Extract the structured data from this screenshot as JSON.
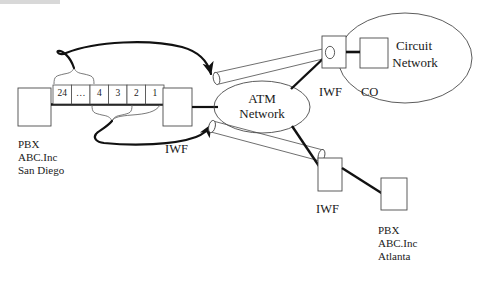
{
  "diagram": {
    "colors": {
      "stroke": "#1a1a1a",
      "thin_stroke": "#555555",
      "background": "#ffffff",
      "text": "#1a1a1a"
    },
    "nodes": {
      "pbx_left": {
        "label": "",
        "x": 18,
        "y": 88,
        "w": 33,
        "h": 38
      },
      "iwf_left": {
        "label": "IWF",
        "x": 163,
        "y": 88,
        "w": 29,
        "h": 38
      },
      "iwf_top": {
        "label": "IWF",
        "x": 322,
        "y": 36,
        "w": 24,
        "h": 32
      },
      "co": {
        "label": "CO",
        "x": 360,
        "y": 38,
        "w": 28,
        "h": 30
      },
      "iwf_bottom": {
        "label": "IWF",
        "x": 318,
        "y": 158,
        "w": 24,
        "h": 33
      },
      "pbx_right": {
        "label": "",
        "x": 381,
        "y": 178,
        "w": 26,
        "h": 32
      }
    },
    "clouds": {
      "atm": {
        "line1": "ATM",
        "line2": "Network",
        "cx": 262,
        "cy": 107,
        "rx": 48,
        "ry": 26
      },
      "circuit": {
        "line1": "Circuit",
        "line2": "Network",
        "cx": 405,
        "cy": 58,
        "rx": 67,
        "ry": 45
      }
    },
    "trunk": {
      "channels": [
        "24",
        "…",
        "4",
        "3",
        "2",
        "1"
      ],
      "x": 53,
      "y": 85,
      "cell_w": 18.5,
      "h": 19
    },
    "labels": {
      "iwf_left": "IWF",
      "iwf_top": "IWF",
      "iwf_bottom": "IWF",
      "co": "CO"
    },
    "sites": {
      "left": {
        "line1": "PBX",
        "line2": "ABC.Inc",
        "line3": "San Diego",
        "x": 18,
        "y": 138
      },
      "right": {
        "line1": "PBX",
        "line2": "ABC.Inc",
        "line3": "Atlanta",
        "x": 378,
        "y": 224
      }
    }
  }
}
